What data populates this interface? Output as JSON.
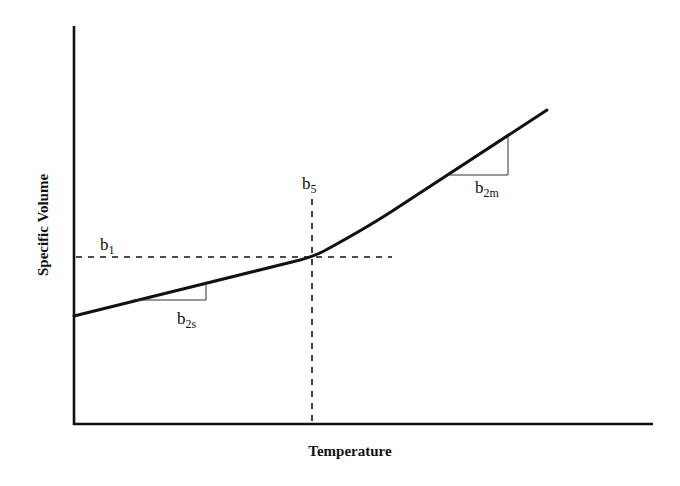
{
  "diagram": {
    "type": "specific-volume-vs-temperature",
    "x_axis_label": "Temperature",
    "y_axis_label": "Specific Volume",
    "annotations": {
      "b1": {
        "base": "b",
        "sub": "1"
      },
      "b5": {
        "base": "b",
        "sub": "5"
      },
      "b2s": {
        "base": "b",
        "sub": "2s"
      },
      "b2m": {
        "base": "b",
        "sub": "2m"
      }
    }
  }
}
